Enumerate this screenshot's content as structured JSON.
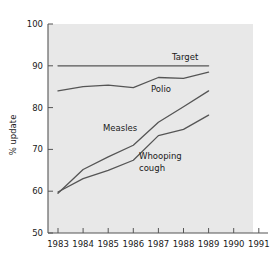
{
  "chart_data": {
    "type": "line",
    "title": "",
    "xlabel": "",
    "ylabel": "% update",
    "xlim": [
      1983,
      1991
    ],
    "ylim": [
      50,
      100
    ],
    "grid": false,
    "legend": "inline-labels",
    "x_ticks": [
      "1983",
      "1984",
      "1985",
      "1986",
      "1987",
      "1988",
      "1989",
      "1990",
      "1991"
    ],
    "y_ticks": [
      "50",
      "60",
      "70",
      "80",
      "90",
      "100"
    ],
    "x": [
      1983,
      1984,
      1985,
      1986,
      1987,
      1988,
      1989
    ],
    "series": [
      {
        "name": "Target",
        "label": "Target",
        "values": [
          90,
          90,
          90,
          90,
          90,
          90,
          90
        ],
        "color": "#555555"
      },
      {
        "name": "Polio",
        "label": "Polio",
        "values": [
          84.0,
          85.0,
          85.4,
          84.8,
          87.2,
          87.0,
          88.5
        ],
        "color": "#555555"
      },
      {
        "name": "Measles",
        "label": "Measles",
        "values": [
          59.5,
          65.2,
          68.2,
          71.0,
          76.5,
          80.2,
          84.0
        ],
        "color": "#555555"
      },
      {
        "name": "Whooping cough",
        "label": "Whooping cough",
        "label_line1": "Whooping",
        "label_line2": "cough",
        "values": [
          59.8,
          63.0,
          65.0,
          67.4,
          73.3,
          74.8,
          78.2
        ],
        "color": "#555555"
      }
    ]
  },
  "axes": {
    "y_title": "% update",
    "y_tick_100": "100",
    "y_tick_90": "90",
    "y_tick_80": "80",
    "y_tick_70": "70",
    "y_tick_60": "60",
    "y_tick_50": "50",
    "x_tick_1983": "1983",
    "x_tick_1984": "1984",
    "x_tick_1985": "1985",
    "x_tick_1986": "1986",
    "x_tick_1987": "1987",
    "x_tick_1988": "1988",
    "x_tick_1989": "1989",
    "x_tick_1990": "1990",
    "x_tick_1991": "1991"
  },
  "labels": {
    "target": "Target",
    "polio": "Polio",
    "measles": "Measles",
    "whooping_line1": "Whooping",
    "whooping_line2": "cough"
  },
  "colors": {
    "plot_background": "#e8e8e8",
    "page_background": "#ffffff",
    "line": "#555555",
    "axis": "#555555",
    "text": "#1a1a1a"
  }
}
